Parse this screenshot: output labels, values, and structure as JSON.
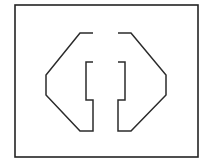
{
  "canvas": {
    "width": 211,
    "height": 165,
    "background_color": "#ffffff",
    "title": "Split Octagon Line Diagram"
  },
  "frame": {
    "label": "Outer rectangular border",
    "x": 15,
    "y": 5,
    "width": 183,
    "height": 152,
    "stroke_color": "#232323",
    "stroke_width": 1.6,
    "fill": "none"
  },
  "figure": {
    "label": "Octagon split into two mirrored halves with inner notches",
    "stroke_color": "#2b2b2b",
    "stroke_width": 1.5,
    "fill": "none",
    "geometry": {
      "left_half_points": "93,33 80,33 46,75 46,95 80,131 93,131 93,100 86,100 86,62 93,62",
      "right_half_points": "118,33 131,33 166,75 166,95 131,131 118,131 118,100 125,100 125,62 118,62",
      "center_gap_x": [
        93,
        118
      ],
      "notch_depth_px": 7,
      "notch_span_y": [
        62,
        100
      ],
      "octagon_top_y": 33,
      "octagon_bottom_y": 131,
      "octagon_left_x": 46,
      "octagon_right_x": 166,
      "vertical_side_span_y": [
        75,
        95
      ]
    }
  },
  "chart_data": {
    "type": "table",
    "xlabel": "",
    "ylabel": "",
    "categories": [
      "outer frame",
      "left half",
      "right half"
    ],
    "values": [
      1,
      1,
      1
    ],
    "elements": [
      {
        "name": "outer-frame",
        "shape": "rectangle",
        "vertices": [
          [
            15,
            5
          ],
          [
            198,
            5
          ],
          [
            198,
            157
          ],
          [
            15,
            157
          ]
        ],
        "closed": true,
        "stroke": "#232323",
        "fill": "none"
      },
      {
        "name": "left-half",
        "shape": "notched-half-octagon",
        "vertices": [
          [
            93,
            33
          ],
          [
            80,
            33
          ],
          [
            46,
            75
          ],
          [
            46,
            95
          ],
          [
            80,
            131
          ],
          [
            93,
            131
          ],
          [
            93,
            100
          ],
          [
            86,
            100
          ],
          [
            86,
            62
          ],
          [
            93,
            62
          ]
        ],
        "closed": false,
        "stroke": "#2b2b2b",
        "fill": "none"
      },
      {
        "name": "right-half",
        "shape": "notched-half-octagon",
        "vertices": [
          [
            118,
            33
          ],
          [
            131,
            33
          ],
          [
            166,
            75
          ],
          [
            166,
            95
          ],
          [
            131,
            131
          ],
          [
            118,
            131
          ],
          [
            118,
            100
          ],
          [
            125,
            100
          ],
          [
            125,
            62
          ],
          [
            118,
            62
          ]
        ],
        "closed": false,
        "stroke": "#2b2b2b",
        "fill": "none"
      }
    ],
    "grid": false,
    "legend_position": "none"
  }
}
